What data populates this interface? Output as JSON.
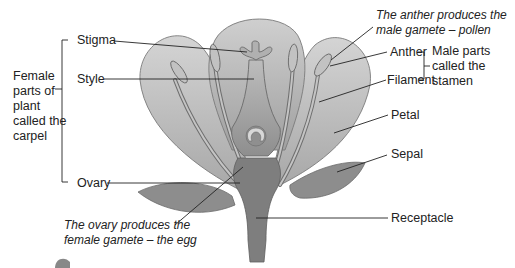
{
  "diagram": {
    "labels": {
      "stigma": "Stigma",
      "style": "Style",
      "ovary": "Ovary",
      "anther": "Anther",
      "filament": "Filament",
      "petal": "Petal",
      "sepal": "Sepal",
      "receptacle": "Receptacle"
    },
    "groups": {
      "female": [
        "Female",
        "parts of",
        "plant",
        "called the",
        "carpel"
      ],
      "male": [
        "Male parts",
        "called the",
        "stamen"
      ]
    },
    "notes": {
      "anther": [
        "The anther produces the",
        "male gamete – pollen"
      ],
      "ovary": [
        "The ovary produces the",
        "female gamete – the egg"
      ]
    },
    "colors": {
      "petal": "#c9c9c9",
      "petal_stroke": "#7a7a7a",
      "sepal": "#8a8a8a",
      "receptacle": "#7d7d7d",
      "carpel": "#a9a9a9",
      "stamen": "#b8b8b8",
      "line": "#222222"
    }
  }
}
